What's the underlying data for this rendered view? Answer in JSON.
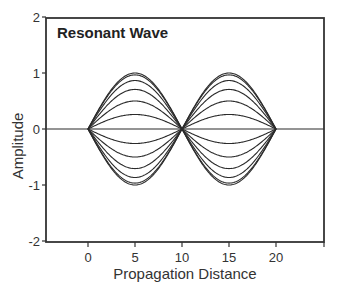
{
  "chart_data": {
    "type": "line",
    "title": "Resonant Wave",
    "xlabel": "Propagation Distance",
    "ylabel": "Amplitude",
    "xlim": [
      -4.5,
      25
    ],
    "ylim": [
      -2,
      2
    ],
    "x_ticks": [
      0,
      5,
      10,
      15,
      20
    ],
    "y_ticks": [
      -2,
      -1,
      0,
      1,
      2
    ],
    "grid": false,
    "legend": null,
    "function": "y = A * sin(pi * x / 10), x in [0, 20]",
    "x": [
      0,
      1,
      2,
      3,
      4,
      5,
      6,
      7,
      8,
      9,
      10,
      11,
      12,
      13,
      14,
      15,
      16,
      17,
      18,
      19,
      20
    ],
    "series": [
      {
        "name": "A=1.000",
        "amplitude": 1.0,
        "values": [
          0,
          0.309,
          0.588,
          0.809,
          0.951,
          1.0,
          0.951,
          0.809,
          0.588,
          0.309,
          0,
          -0.309,
          -0.588,
          -0.809,
          -0.951,
          -1.0,
          -0.951,
          -0.809,
          -0.588,
          -0.309,
          0
        ]
      },
      {
        "name": "A=0.966",
        "amplitude": 0.966
      },
      {
        "name": "A=0.866",
        "amplitude": 0.866
      },
      {
        "name": "A=0.707",
        "amplitude": 0.707
      },
      {
        "name": "A=0.500",
        "amplitude": 0.5
      },
      {
        "name": "A=0.259",
        "amplitude": 0.259
      },
      {
        "name": "A=0.000",
        "amplitude": 0.0
      },
      {
        "name": "A=-0.259",
        "amplitude": -0.259
      },
      {
        "name": "A=-0.500",
        "amplitude": -0.5
      },
      {
        "name": "A=-0.707",
        "amplitude": -0.707
      },
      {
        "name": "A=-0.866",
        "amplitude": -0.866
      },
      {
        "name": "A=-0.966",
        "amplitude": -0.966
      },
      {
        "name": "A=-1.000",
        "amplitude": -1.0
      }
    ],
    "baseline": {
      "y": 0,
      "x_range": [
        -4.5,
        25
      ]
    }
  },
  "layout_px": {
    "plot_left": 46,
    "plot_right": 324,
    "plot_top": 18,
    "plot_bottom": 242,
    "x0_px": 88,
    "px_per_x": 9.4,
    "y0_px": 129,
    "px_per_y": 56
  },
  "colors": {
    "line": "#2a2a2a",
    "frame": "#333333",
    "background": "#ffffff"
  }
}
